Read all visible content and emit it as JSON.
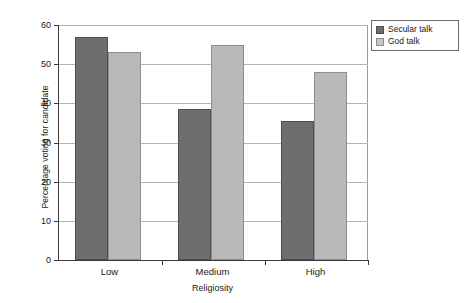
{
  "chart_data": {
    "type": "bar",
    "title": "",
    "subtitle": "",
    "xlabel": "Religiosity",
    "ylabel": "Percentage voting for candidate",
    "categories": [
      "Low",
      "Medium",
      "High"
    ],
    "series": [
      {
        "name": "Secular talk",
        "color": "#6e6e6e",
        "values": [
          57,
          38.5,
          35.5
        ]
      },
      {
        "name": "God talk",
        "color": "#b9b9b9",
        "values": [
          53,
          55,
          48
        ]
      }
    ],
    "ylim": [
      0,
      60
    ],
    "yticks": [
      0,
      10,
      20,
      30,
      40,
      50,
      60
    ],
    "ytick_labels": [
      "0",
      "10",
      "20",
      "30",
      "40",
      "50",
      "60"
    ],
    "grid": true,
    "grid_axis": "y",
    "legend_position": "upper right outside"
  },
  "legend": {
    "items": [
      {
        "label": "Secular talk",
        "swatch": "secular-swatch"
      },
      {
        "label": "God talk",
        "swatch": "god-swatch"
      }
    ]
  },
  "axes": {
    "y_title": "Percentage voting for candidate",
    "x_title": "Religiosity"
  },
  "colors": {
    "secular": "#6e6e6e",
    "god": "#b9b9b9",
    "axis": "#3a3a3a",
    "grid": "#b5b5b5",
    "background": "#ffffff",
    "text": "#1a1a1a"
  }
}
